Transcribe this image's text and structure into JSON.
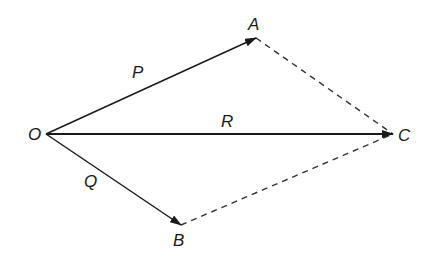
{
  "diagram": {
    "points": {
      "O": {
        "label": "O",
        "x": 46,
        "y": 134
      },
      "A": {
        "label": "A",
        "x": 256,
        "y": 38
      },
      "B": {
        "label": "B",
        "x": 181,
        "y": 225
      },
      "C": {
        "label": "C",
        "x": 393,
        "y": 134
      }
    },
    "vectors": [
      {
        "name": "P",
        "from": "O",
        "to": "A",
        "style": "solid-arrow"
      },
      {
        "name": "Q",
        "from": "O",
        "to": "B",
        "style": "solid-arrow"
      },
      {
        "name": "R",
        "from": "O",
        "to": "C",
        "style": "solid-arrow"
      }
    ],
    "dashed_edges": [
      {
        "from": "A",
        "to": "C"
      },
      {
        "from": "B",
        "to": "C"
      }
    ],
    "labels": {
      "O": "O",
      "A": "A",
      "B": "B",
      "C": "C",
      "P": "P",
      "Q": "Q",
      "R": "R"
    },
    "colors": {
      "line": "#1a1a1a",
      "dashed": "#333333"
    }
  }
}
